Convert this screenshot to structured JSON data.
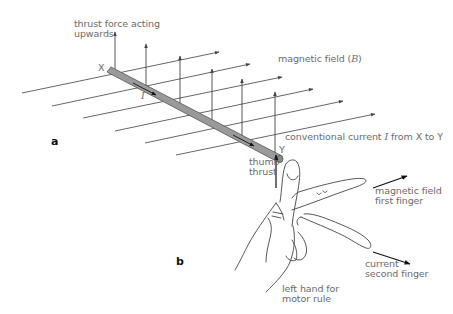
{
  "diagram": {
    "panels": {
      "a": "a",
      "b": "b"
    },
    "labels": {
      "thrust_force": [
        "thrust force acting",
        "upwards"
      ],
      "magnetic_field": "magnetic field (",
      "magnetic_field_symbol": "B",
      "magnetic_field_close": ")",
      "end_x": "X",
      "end_y": "Y",
      "current_symbol": "I",
      "conventional_current_pre": "conventional current ",
      "conventional_current_symbol": "I",
      "conventional_current_post": " from X to Y",
      "thumb": "thumb",
      "thrust": "thrust",
      "field_finger_1": "magnetic field",
      "field_finger_2": "first finger",
      "current_finger_1": "current",
      "current_finger_2": "second finger",
      "hand_caption_1": "left hand for",
      "hand_caption_2": "motor rule"
    },
    "colors": {
      "line": "#555555",
      "rod_fill": "#9a9a9a",
      "rod_edge": "#555555",
      "text": "#6b6b6b"
    }
  }
}
